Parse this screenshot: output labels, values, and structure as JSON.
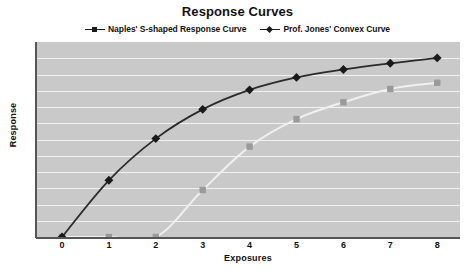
{
  "chart_data": {
    "type": "line",
    "title": "Response Curves",
    "xlabel": "Exposures",
    "ylabel": "Response",
    "x": [
      0,
      1,
      2,
      3,
      4,
      5,
      6,
      7,
      8
    ],
    "xtick_labels": [
      "0",
      "1",
      "2",
      "3",
      "4",
      "5",
      "6",
      "7",
      "8"
    ],
    "xlim": [
      0,
      8
    ],
    "ylim": [
      0,
      11
    ],
    "ytick_labels": [],
    "grid": "horizontal",
    "gridline_count": 11,
    "legend_position": "top-center",
    "series": [
      {
        "name": "Naples' S-shaped Response Curve",
        "marker": "square",
        "color": "#9a9a9a",
        "line_color": "#f0f0f0",
        "values": [
          0,
          0,
          0,
          2.65,
          5.1,
          6.65,
          7.6,
          8.35,
          8.7
        ]
      },
      {
        "name": "Prof. Jones' Convex Curve",
        "marker": "diamond",
        "color": "#1a1a1a",
        "line_color": "#2b2b2b",
        "values": [
          0,
          3.2,
          5.55,
          7.2,
          8.3,
          9.0,
          9.45,
          9.8,
          10.1
        ]
      }
    ]
  },
  "legend": {
    "entries": [
      {
        "label": "Naples' S-shaped Response Curve",
        "marker": "square-marker-icon",
        "color": "#1a1a1a"
      },
      {
        "label": "Prof. Jones' Convex Curve",
        "marker": "diamond-marker-icon",
        "color": "#1a1a1a"
      }
    ]
  },
  "colors": {
    "plot_background": "#c9c9c9",
    "gridline": "#f2f2f2",
    "axis": "#555555",
    "dark_series": "#1a1a1a",
    "light_series": "#9a9a9a",
    "light_series_line": "#f0f0f0"
  }
}
